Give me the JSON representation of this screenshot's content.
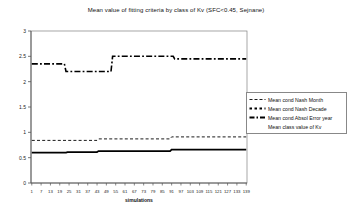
{
  "window": {
    "background": "#ffffff"
  },
  "chart_data": {
    "type": "line",
    "title": "Mean value of fitting criteria by class of Kv (SFC<0.45, Sejnane)",
    "xlabel": "simulations",
    "ylabel": "",
    "ylim": [
      0,
      3
    ],
    "xlim": [
      1,
      139
    ],
    "y_ticks": [
      "0",
      "0.5",
      "1",
      "1.5",
      "2",
      "2.5",
      "3"
    ],
    "x_ticks": [
      "1",
      "7",
      "13",
      "19",
      "25",
      "31",
      "37",
      "43",
      "49",
      "55",
      "61",
      "67",
      "73",
      "79",
      "85",
      "91",
      "97",
      "103",
      "109",
      "115",
      "121",
      "127",
      "133",
      "139"
    ],
    "grid": false,
    "legend_position": "right",
    "line_color": "#000000",
    "axis_color": "#808080",
    "legend": [
      {
        "label": "Mean cond  Nash Month",
        "style": "thin-dashed",
        "dash": "3 2",
        "width": 0.9
      },
      {
        "label": "Mean cond Nash Decade",
        "style": "bold-square-dash",
        "dash": "2.5 2.5",
        "width": 2
      },
      {
        "label": "Mean cond Absol Error year",
        "style": "bold-dash-dot",
        "dash": "5 2 1.5 2",
        "width": 2
      },
      {
        "label": "Mean class value of Kv",
        "style": "no-sample",
        "dash": "",
        "width": 0
      }
    ],
    "series": [
      {
        "name": "Mean cond Absol Error year",
        "style": "bold-dash-dot",
        "dash": "6 2.2 1.8 2.2",
        "width": 1.6,
        "points": [
          [
            1,
            2.35
          ],
          [
            22,
            2.35
          ],
          [
            23,
            2.2
          ],
          [
            52,
            2.2
          ],
          [
            53,
            2.5
          ],
          [
            92,
            2.5
          ],
          [
            93,
            2.45
          ],
          [
            139,
            2.45
          ]
        ]
      },
      {
        "name": "Mean cond  Nash Month",
        "style": "thin-dashed",
        "dash": "3 2.2",
        "width": 0.9,
        "points": [
          [
            1,
            0.84
          ],
          [
            43,
            0.84
          ],
          [
            44,
            0.87
          ],
          [
            90,
            0.87
          ],
          [
            91,
            0.91
          ],
          [
            139,
            0.91
          ]
        ]
      },
      {
        "name": "Mean class value of Kv",
        "style": "solid-bold",
        "dash": "",
        "width": 1.8,
        "points": [
          [
            1,
            0.6
          ],
          [
            23,
            0.6
          ],
          [
            24,
            0.61
          ],
          [
            43,
            0.61
          ],
          [
            44,
            0.63
          ],
          [
            90,
            0.63
          ],
          [
            91,
            0.66
          ],
          [
            139,
            0.66
          ]
        ]
      }
    ],
    "note": "Mean cond Nash Decade series is not separately distinguishable in the plot (it overlaps the upper dash-dot line)."
  }
}
